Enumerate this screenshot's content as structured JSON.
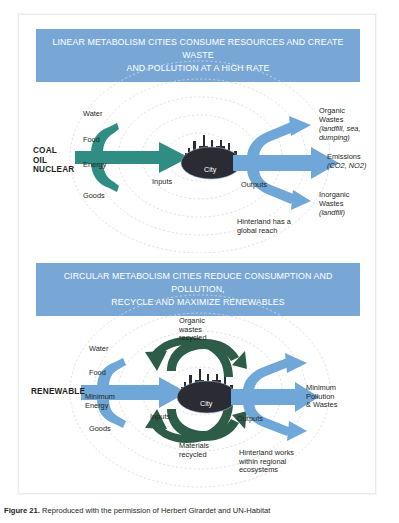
{
  "figure": {
    "caption_prefix": "Figure 21.",
    "caption_text": " Reproduced with the permission of Herbert Girardet and UN-Habitat"
  },
  "colors": {
    "banner_blue": "#78a7d6",
    "arrow_blue": "#6ea7d8",
    "arrow_teal": "#2f8d84",
    "arrow_darkgreen": "#2d5c49",
    "city_dark": "#2b2b33",
    "ring_gray": "#d6d7e2",
    "text": "#231f20"
  },
  "panels": [
    {
      "id": "linear",
      "banner": {
        "line1": "LINEAR METABOLISM CITIES CONSUME RESOURCES AND CREATE WASTE",
        "line2": "AND POLLUTION AT A HIGH RATE"
      },
      "source_label": "COAL\nOIL\nNUCLEAR",
      "inputs": [
        "Water",
        "Food",
        "Energy",
        "Goods"
      ],
      "inputs_caption": "Inputs",
      "city_label": "City",
      "outputs_caption": "Outputs",
      "outputs": [
        {
          "title": "Organic\nWastes",
          "detail": "(landfill, sea,\ndumping)"
        },
        {
          "title": "Emissions",
          "detail": "(CO2, NO2)"
        },
        {
          "title": "Inorganic\nWastes",
          "detail": "(landfill)"
        }
      ],
      "hinterland": "Hinterland has a\nglobal reach"
    },
    {
      "id": "circular",
      "banner": {
        "line1": "CIRCULAR METABOLISM CITIES REDUCE CONSUMPTION AND POLLUTION,",
        "line2": "RECYCLE AND MAXIMIZE RENEWABLES"
      },
      "source_label": "RENEWABLE",
      "inputs": [
        "Water",
        "Food",
        "Minimum\nEnergy",
        "Goods"
      ],
      "inputs_caption": "Inputs",
      "city_label": "City",
      "outputs_caption": "Outputs",
      "recycle_top": "Organic\nwastes\nrecycled",
      "recycle_bottom": "Materials\nrecycled",
      "outputs": [
        {
          "title": "Minimum\nPollution\n& Wastes",
          "detail": ""
        }
      ],
      "hinterland": "Hinterland works\nwithin regional\necosystems"
    }
  ]
}
